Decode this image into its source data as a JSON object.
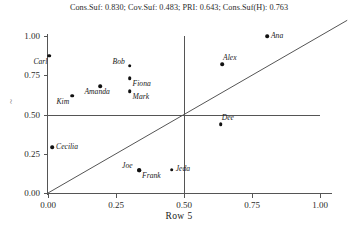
{
  "chart_data": {
    "type": "scatter",
    "title": "Cons.Suf: 0.830; Cov.Suf: 0.483; PRI: 0.643; Cons.Suf(H): 0.763",
    "xlabel": "Row 5",
    "ylabel": "~",
    "xlim": [
      0,
      1
    ],
    "ylim": [
      0,
      1
    ],
    "grid": false,
    "legend": "none",
    "xticks": [
      "0.00",
      "0.25",
      "0.50",
      "0.75",
      "1.00"
    ],
    "xtick_values": [
      0,
      0.25,
      0.5,
      0.75,
      1
    ],
    "yticks": [
      "0.00",
      "0.25",
      "0.50",
      "0.75",
      "1.00"
    ],
    "ytick_values": [
      0,
      0.25,
      0.5,
      0.75,
      1
    ],
    "reference_lines": [
      {
        "name": "horizontal-threshold",
        "orientation": "horizontal",
        "value": 0.5
      },
      {
        "name": "vertical-threshold",
        "orientation": "vertical",
        "value": 0.5
      },
      {
        "name": "diagonal-identity",
        "orientation": "diagonal",
        "from": [
          0,
          0
        ],
        "to": [
          1.1,
          1.1
        ]
      }
    ],
    "points": [
      {
        "label": "Carl",
        "x": 0.005,
        "y": 0.875,
        "label_pos": "below-left"
      },
      {
        "label": "Kim",
        "x": 0.09,
        "y": 0.62,
        "label_pos": "below-left"
      },
      {
        "label": "Amanda",
        "x": 0.193,
        "y": 0.68,
        "label_pos": "below-left"
      },
      {
        "label": "Bob",
        "x": 0.3,
        "y": 0.81,
        "label_pos": "above-left"
      },
      {
        "label": "Fiona",
        "x": 0.3,
        "y": 0.73,
        "label_pos": "below-right"
      },
      {
        "label": "Mark",
        "x": 0.3,
        "y": 0.65,
        "label_pos": "below-right"
      },
      {
        "label": "Alex",
        "x": 0.64,
        "y": 0.82,
        "label_pos": "above-right"
      },
      {
        "label": "Ana",
        "x": 0.805,
        "y": 1.0,
        "label_pos": "right"
      },
      {
        "label": "Dee",
        "x": 0.635,
        "y": 0.44,
        "label_pos": "above-right"
      },
      {
        "label": "Cecilia",
        "x": 0.015,
        "y": 0.29,
        "label_pos": "right"
      },
      {
        "label": "Joe",
        "x": 0.335,
        "y": 0.145,
        "label_pos": "above-left"
      },
      {
        "label": "Frank",
        "x": 0.335,
        "y": 0.145,
        "label_pos": "below-right"
      },
      {
        "label": "Jeda",
        "x": 0.455,
        "y": 0.148,
        "label_pos": "right"
      }
    ]
  },
  "colors": {
    "point": "#111111",
    "axis": "#555555",
    "text": "#1a1a1a",
    "background": "#ffffff"
  }
}
